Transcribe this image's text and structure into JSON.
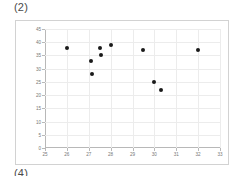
{
  "figure": {
    "label": "(2)",
    "next_label": "(4)"
  },
  "chart_data": {
    "type": "scatter",
    "title": "(2)",
    "xlabel": "",
    "ylabel": "",
    "xlim": [
      25,
      33
    ],
    "ylim": [
      0,
      45
    ],
    "xticks": [
      25,
      26,
      27,
      28,
      29,
      30,
      31,
      32,
      33
    ],
    "yticks": [
      0,
      5,
      10,
      15,
      20,
      25,
      30,
      35,
      40,
      45
    ],
    "xtick_labels": [
      "25",
      "26",
      "27",
      "28",
      "29",
      "30",
      "31",
      "32",
      "33"
    ],
    "ytick_labels": [
      "0",
      "5",
      "10",
      "15",
      "20",
      "25",
      "30",
      "35",
      "40",
      "45"
    ],
    "grid": true,
    "legend": null,
    "marker_color": "#1a1a1a",
    "marker": "circle",
    "points": [
      {
        "x": 26.0,
        "y": 38
      },
      {
        "x": 27.1,
        "y": 33
      },
      {
        "x": 27.15,
        "y": 28
      },
      {
        "x": 27.5,
        "y": 38
      },
      {
        "x": 27.55,
        "y": 35
      },
      {
        "x": 28.0,
        "y": 39
      },
      {
        "x": 29.5,
        "y": 37
      },
      {
        "x": 30.0,
        "y": 25
      },
      {
        "x": 30.3,
        "y": 22
      },
      {
        "x": 32.0,
        "y": 37
      }
    ]
  },
  "colors": {
    "frame_border": "#d2d2d2",
    "axis": "#b8b8b8",
    "grid": "#ececec",
    "tick_text": "#777777",
    "label_text": "#4a4a4a",
    "background": "#ffffff"
  }
}
